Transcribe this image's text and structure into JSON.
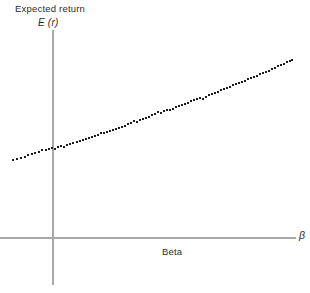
{
  "chart_data": {
    "type": "scatter",
    "title": "Expected return",
    "ylabel": "E (r)",
    "xlabel": "Beta",
    "xlabel_symbol": "β",
    "grid": false,
    "legend": null,
    "axes": {
      "origin_x_px": 53,
      "origin_y_px": 238,
      "y_axis_top_px": 30,
      "y_axis_bottom_px": 285,
      "x_axis_left_px": 0,
      "x_axis_right_px": 296,
      "xlim": [
        -0.35,
        2.0
      ],
      "ylim": [
        0,
        0.26
      ]
    },
    "fit_line": {
      "intercept": 0.088,
      "slope": 0.075
    },
    "marker": {
      "shape": "square",
      "size_px": 2,
      "color": "#1c1c1c"
    },
    "points": [
      {
        "x_px": 13,
        "y_px": 160
      },
      {
        "x_px": 17,
        "y_px": 159
      },
      {
        "x_px": 21,
        "y_px": 158
      },
      {
        "x_px": 25,
        "y_px": 157
      },
      {
        "x_px": 28,
        "y_px": 155
      },
      {
        "x_px": 32,
        "y_px": 154
      },
      {
        "x_px": 35,
        "y_px": 153
      },
      {
        "x_px": 39,
        "y_px": 152
      },
      {
        "x_px": 42,
        "y_px": 150
      },
      {
        "x_px": 46,
        "y_px": 150
      },
      {
        "x_px": 49,
        "y_px": 149
      },
      {
        "x_px": 52,
        "y_px": 148
      },
      {
        "x_px": 55,
        "y_px": 149
      },
      {
        "x_px": 58,
        "y_px": 147
      },
      {
        "x_px": 61,
        "y_px": 146
      },
      {
        "x_px": 64,
        "y_px": 147
      },
      {
        "x_px": 67,
        "y_px": 145
      },
      {
        "x_px": 70,
        "y_px": 144
      },
      {
        "x_px": 73,
        "y_px": 143
      },
      {
        "x_px": 77,
        "y_px": 142
      },
      {
        "x_px": 80,
        "y_px": 141
      },
      {
        "x_px": 83,
        "y_px": 140
      },
      {
        "x_px": 86,
        "y_px": 139
      },
      {
        "x_px": 89,
        "y_px": 138
      },
      {
        "x_px": 92,
        "y_px": 137
      },
      {
        "x_px": 95,
        "y_px": 136
      },
      {
        "x_px": 98,
        "y_px": 135
      },
      {
        "x_px": 101,
        "y_px": 133
      },
      {
        "x_px": 104,
        "y_px": 133
      },
      {
        "x_px": 107,
        "y_px": 132
      },
      {
        "x_px": 110,
        "y_px": 131
      },
      {
        "x_px": 113,
        "y_px": 130
      },
      {
        "x_px": 116,
        "y_px": 129
      },
      {
        "x_px": 119,
        "y_px": 128
      },
      {
        "x_px": 122,
        "y_px": 127
      },
      {
        "x_px": 125,
        "y_px": 126
      },
      {
        "x_px": 128,
        "y_px": 124
      },
      {
        "x_px": 131,
        "y_px": 123
      },
      {
        "x_px": 134,
        "y_px": 121
      },
      {
        "x_px": 137,
        "y_px": 122
      },
      {
        "x_px": 140,
        "y_px": 120
      },
      {
        "x_px": 143,
        "y_px": 119
      },
      {
        "x_px": 146,
        "y_px": 118
      },
      {
        "x_px": 149,
        "y_px": 117
      },
      {
        "x_px": 152,
        "y_px": 115
      },
      {
        "x_px": 155,
        "y_px": 114
      },
      {
        "x_px": 158,
        "y_px": 112
      },
      {
        "x_px": 161,
        "y_px": 113
      },
      {
        "x_px": 164,
        "y_px": 111
      },
      {
        "x_px": 167,
        "y_px": 110
      },
      {
        "x_px": 170,
        "y_px": 110
      },
      {
        "x_px": 173,
        "y_px": 109
      },
      {
        "x_px": 176,
        "y_px": 107
      },
      {
        "x_px": 179,
        "y_px": 106
      },
      {
        "x_px": 182,
        "y_px": 105
      },
      {
        "x_px": 185,
        "y_px": 104
      },
      {
        "x_px": 188,
        "y_px": 103
      },
      {
        "x_px": 191,
        "y_px": 101
      },
      {
        "x_px": 194,
        "y_px": 100
      },
      {
        "x_px": 197,
        "y_px": 99
      },
      {
        "x_px": 200,
        "y_px": 98
      },
      {
        "x_px": 203,
        "y_px": 99
      },
      {
        "x_px": 206,
        "y_px": 97
      },
      {
        "x_px": 209,
        "y_px": 95
      },
      {
        "x_px": 212,
        "y_px": 94
      },
      {
        "x_px": 215,
        "y_px": 93
      },
      {
        "x_px": 218,
        "y_px": 92
      },
      {
        "x_px": 221,
        "y_px": 90
      },
      {
        "x_px": 224,
        "y_px": 89
      },
      {
        "x_px": 227,
        "y_px": 88
      },
      {
        "x_px": 230,
        "y_px": 87
      },
      {
        "x_px": 233,
        "y_px": 85
      },
      {
        "x_px": 236,
        "y_px": 84
      },
      {
        "x_px": 239,
        "y_px": 83
      },
      {
        "x_px": 242,
        "y_px": 82
      },
      {
        "x_px": 245,
        "y_px": 81
      },
      {
        "x_px": 248,
        "y_px": 79
      },
      {
        "x_px": 251,
        "y_px": 78
      },
      {
        "x_px": 254,
        "y_px": 77
      },
      {
        "x_px": 257,
        "y_px": 76
      },
      {
        "x_px": 260,
        "y_px": 74
      },
      {
        "x_px": 263,
        "y_px": 73
      },
      {
        "x_px": 266,
        "y_px": 72
      },
      {
        "x_px": 269,
        "y_px": 71
      },
      {
        "x_px": 272,
        "y_px": 69
      },
      {
        "x_px": 275,
        "y_px": 68
      },
      {
        "x_px": 278,
        "y_px": 66
      },
      {
        "x_px": 281,
        "y_px": 65
      },
      {
        "x_px": 284,
        "y_px": 64
      },
      {
        "x_px": 287,
        "y_px": 62
      },
      {
        "x_px": 290,
        "y_px": 61
      },
      {
        "x_px": 292,
        "y_px": 60
      }
    ]
  }
}
